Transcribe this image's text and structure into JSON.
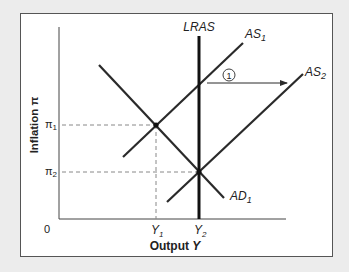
{
  "diagram": {
    "title": "",
    "axes": {
      "x_label": "Output",
      "x_label_var": "Y",
      "y_label": "Inflation π",
      "origin_label": "0"
    },
    "curves": {
      "lras": {
        "name": "LRAS"
      },
      "as1": {
        "name": "AS",
        "sub": "1"
      },
      "as2": {
        "name": "AS",
        "sub": "2"
      },
      "ad1": {
        "name": "AD",
        "sub": "1"
      }
    },
    "ticks": {
      "y1": {
        "name": "Y",
        "sub": "1"
      },
      "y2": {
        "name": "Y",
        "sub": "2"
      },
      "pi1": {
        "name": "π",
        "sub": "1"
      },
      "pi2": {
        "name": "π",
        "sub": "2"
      }
    },
    "annotations": {
      "step_marker": "1"
    },
    "colors": {
      "line": "#2a2a2a",
      "dashed": "#888888",
      "frame_bg": "#ffffff",
      "page_bg": "#ececec"
    }
  }
}
